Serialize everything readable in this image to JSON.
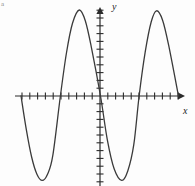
{
  "figure": {
    "name": "sinusoid-graph",
    "width": 195,
    "height": 186,
    "background_color": "#fdfdfd",
    "corner_mark": "a"
  },
  "axes": {
    "x_label": "x",
    "y_label": "y",
    "stroke_color": "#2b2b2b",
    "origin_px": [
      100,
      96
    ],
    "x_axis_start_px": [
      15,
      96
    ],
    "x_axis_end_px": [
      182,
      96
    ],
    "y_axis_top_px": [
      100,
      8
    ],
    "y_axis_bottom_px": [
      100,
      186
    ],
    "tick_spacing_px": 7.8,
    "tick_length_px": 7,
    "x_ticks_left_count": 11,
    "x_ticks_right_count": 10,
    "y_ticks_up_count": 11,
    "y_ticks_down_count": 11,
    "arrow_x": "right",
    "arrow_y": "up",
    "tick_labels_shown": false
  },
  "curve": {
    "stroke_color": "#3a3a3a",
    "stroke_width": 1.3,
    "fill": "none",
    "description": "smooth sinusoidal curve, two full cycles, starting downward from the left zero"
  },
  "chart_data": {
    "type": "line",
    "title": "",
    "xlabel": "x",
    "ylabel": "y",
    "grid": false,
    "legend": null,
    "xlim": [
      -10.9,
      10.5
    ],
    "ylim": [
      -11.5,
      11.3
    ],
    "amplitude_units": 11.0,
    "period_units": 10.4,
    "zeros_units": [
      -10.5,
      -5.3,
      0.0,
      5.1,
      10.3
    ],
    "maxima_units": [
      [
        -2.8,
        11.0
      ],
      [
        7.4,
        10.9
      ]
    ],
    "minima_units": [
      [
        -7.7,
        -10.8
      ],
      [
        2.8,
        -10.8
      ]
    ],
    "series": [
      {
        "name": "y",
        "x": [
          -10.5,
          -9.8,
          -9.1,
          -8.4,
          -7.7,
          -7.0,
          -6.3,
          -5.3,
          -4.5,
          -3.7,
          -2.8,
          -2.0,
          -1.2,
          0.0,
          0.9,
          1.8,
          2.8,
          3.6,
          4.4,
          5.1,
          5.9,
          6.7,
          7.4,
          8.2,
          9.0,
          10.3
        ],
        "y": [
          0.0,
          -4.3,
          -7.8,
          -10.0,
          -10.8,
          -10.0,
          -7.6,
          0.0,
          5.5,
          9.3,
          11.0,
          9.6,
          6.2,
          0.0,
          -5.6,
          -9.3,
          -10.8,
          -9.6,
          -6.2,
          0.0,
          5.6,
          9.5,
          10.9,
          9.7,
          6.5,
          0.0
        ]
      }
    ]
  }
}
